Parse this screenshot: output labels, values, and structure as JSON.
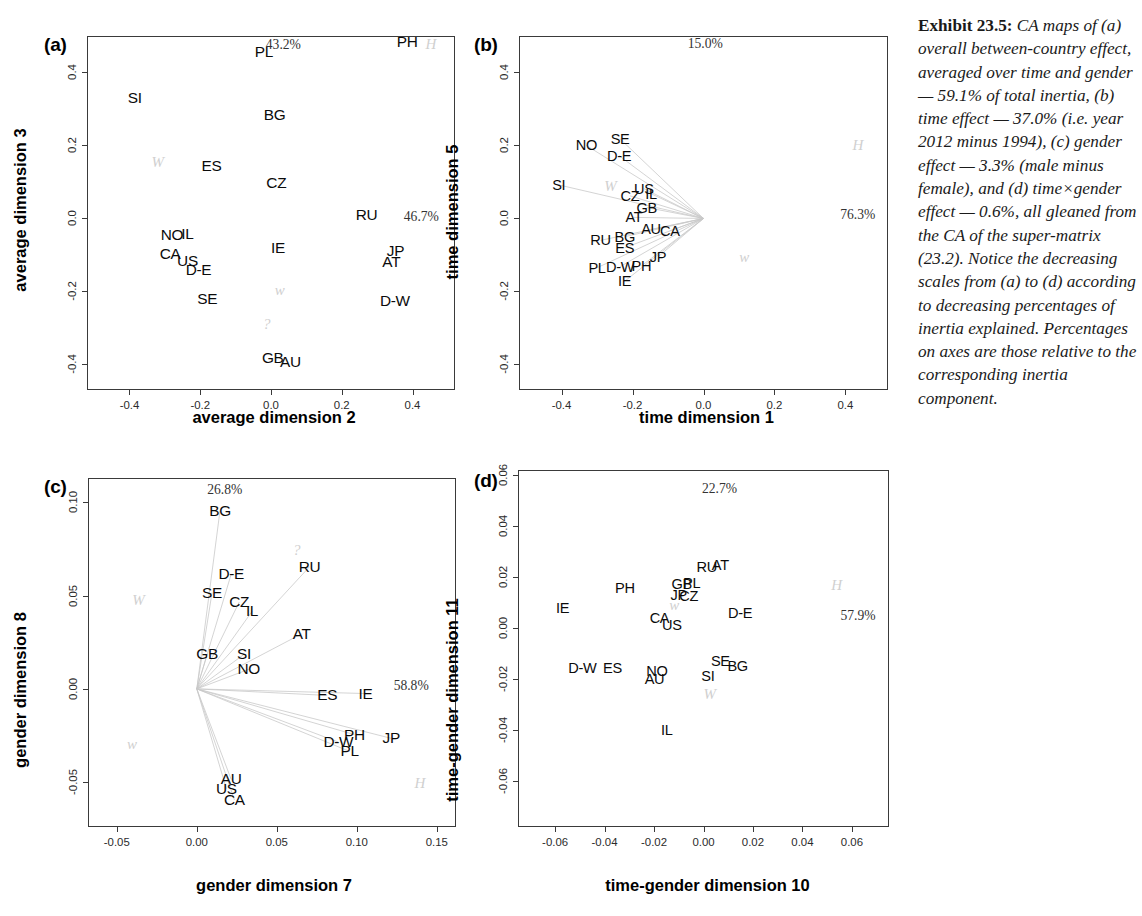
{
  "exhibit": {
    "label": "Exhibit 23.5:",
    "text": "CA maps of (a) overall between-country effect, averaged over time and gender — 59.1% of total inertia, (b) time effect — 37.0% (i.e. year 2012 minus 1994), (c) gender effect — 3.3% (male minus female), and (d) time×gender effect — 0.6%, all gleaned from the CA of the super-matrix (23.2). Notice the decreasing scales from (a) to (d) according to decreasing percentages of inertia explained. Percentages on axes are those relative to the corresponding inertia component."
  },
  "chart_data": [
    {
      "type": "scatter",
      "panel": "a",
      "panel_label": "(a)",
      "xlabel": "average dimension 2",
      "ylabel": "average dimension 3",
      "xlim": [
        -0.52,
        0.52
      ],
      "ylim": [
        -0.47,
        0.5
      ],
      "xticks": [
        -0.4,
        -0.2,
        0.0,
        0.2,
        0.4
      ],
      "xticklabels": [
        "-0.4",
        "-0.2",
        "0.0",
        "0.2",
        "0.4"
      ],
      "yticks": [
        0.4,
        0.2,
        0.0,
        -0.2,
        -0.4
      ],
      "yticklabels": [
        "0.4",
        "0.2",
        "0.0",
        "-0.2",
        "-0.4"
      ],
      "grid": false,
      "rays": false,
      "x_pct": "46.7%",
      "y_pct": "43.2%",
      "x_pct_pos": [
        0.425,
        0.005
      ],
      "y_pct_pos": [
        0.035,
        0.475
      ],
      "points": [
        {
          "label": "PL",
          "x": -0.02,
          "y": 0.455
        },
        {
          "label": "PH",
          "x": 0.385,
          "y": 0.483
        },
        {
          "label": "SI",
          "x": -0.385,
          "y": 0.33
        },
        {
          "label": "BG",
          "x": 0.01,
          "y": 0.283
        },
        {
          "label": "ES",
          "x": -0.168,
          "y": 0.143
        },
        {
          "label": "CZ",
          "x": 0.015,
          "y": 0.098
        },
        {
          "label": "RU",
          "x": 0.27,
          "y": 0.01
        },
        {
          "label": "NO",
          "x": -0.28,
          "y": -0.046
        },
        {
          "label": "IL",
          "x": -0.236,
          "y": -0.042
        },
        {
          "label": "IE",
          "x": 0.02,
          "y": -0.082
        },
        {
          "label": "JP",
          "x": 0.352,
          "y": -0.09
        },
        {
          "label": "CA",
          "x": -0.285,
          "y": -0.097
        },
        {
          "label": "US",
          "x": -0.236,
          "y": -0.116
        },
        {
          "label": "AT",
          "x": 0.34,
          "y": -0.12
        },
        {
          "label": "D-E",
          "x": -0.205,
          "y": -0.142
        },
        {
          "label": "SE",
          "x": -0.18,
          "y": -0.222
        },
        {
          "label": "D-W",
          "x": 0.35,
          "y": -0.225
        },
        {
          "label": "GB",
          "x": 0.005,
          "y": -0.382
        },
        {
          "label": "AU",
          "x": 0.055,
          "y": -0.393
        }
      ],
      "supplementary": [
        {
          "label": "H",
          "x": 0.452,
          "y": 0.478
        },
        {
          "label": "W",
          "x": -0.32,
          "y": 0.155
        },
        {
          "label": "w",
          "x": 0.025,
          "y": -0.195
        },
        {
          "label": "?",
          "x": -0.012,
          "y": -0.29
        }
      ]
    },
    {
      "type": "scatter",
      "panel": "b",
      "panel_label": "(b)",
      "xlabel": "time dimension 1",
      "ylabel": "time dimension 5",
      "xlim": [
        -0.52,
        0.52
      ],
      "ylim": [
        -0.47,
        0.5
      ],
      "xticks": [
        -0.4,
        -0.2,
        0.0,
        0.2,
        0.4
      ],
      "xticklabels": [
        "-0.4",
        "-0.2",
        "0.0",
        "0.2",
        "0.4"
      ],
      "yticks": [
        0.4,
        0.2,
        0.0,
        -0.2,
        -0.4
      ],
      "yticklabels": [
        "0.4",
        "0.2",
        "0.0",
        "-0.2",
        "-0.4"
      ],
      "grid": false,
      "rays": true,
      "ray_origin": [
        0.0,
        0.0
      ],
      "x_pct": "76.3%",
      "y_pct": "15.0%",
      "x_pct_pos": [
        0.435,
        0.01
      ],
      "y_pct_pos": [
        0.005,
        0.478
      ],
      "points": [
        {
          "label": "SE",
          "x": -0.235,
          "y": 0.218
        },
        {
          "label": "NO",
          "x": -0.33,
          "y": 0.2
        },
        {
          "label": "D-E",
          "x": -0.238,
          "y": 0.172
        },
        {
          "label": "SI",
          "x": -0.408,
          "y": 0.092
        },
        {
          "label": "US",
          "x": -0.168,
          "y": 0.082
        },
        {
          "label": "CZ",
          "x": -0.207,
          "y": 0.062
        },
        {
          "label": "IL",
          "x": -0.148,
          "y": 0.068
        },
        {
          "label": "GB",
          "x": -0.16,
          "y": 0.03
        },
        {
          "label": "AT",
          "x": -0.196,
          "y": 0.003
        },
        {
          "label": "AU",
          "x": -0.148,
          "y": -0.03
        },
        {
          "label": "CA",
          "x": -0.095,
          "y": -0.034
        },
        {
          "label": "BG",
          "x": -0.222,
          "y": -0.05
        },
        {
          "label": "RU",
          "x": -0.29,
          "y": -0.06
        },
        {
          "label": "ES",
          "x": -0.222,
          "y": -0.08
        },
        {
          "label": "JP",
          "x": -0.128,
          "y": -0.105
        },
        {
          "label": "PL",
          "x": -0.3,
          "y": -0.135
        },
        {
          "label": "D-W",
          "x": -0.235,
          "y": -0.132
        },
        {
          "label": "PH",
          "x": -0.175,
          "y": -0.13
        },
        {
          "label": "IE",
          "x": -0.222,
          "y": -0.172
        }
      ],
      "supplementary": [
        {
          "label": "H",
          "x": 0.435,
          "y": 0.2
        },
        {
          "label": "W",
          "x": -0.262,
          "y": 0.09
        },
        {
          "label": "w",
          "x": 0.115,
          "y": -0.105
        }
      ]
    },
    {
      "type": "scatter",
      "panel": "c",
      "panel_label": "(c)",
      "xlabel": "gender dimension 7",
      "ylabel": "gender dimension 8",
      "xlim": [
        -0.068,
        0.162
      ],
      "ylim": [
        -0.074,
        0.113
      ],
      "xticks": [
        -0.05,
        0.0,
        0.05,
        0.1,
        0.15
      ],
      "xticklabels": [
        "-0.05",
        "0.00",
        "0.05",
        "0.10",
        "0.15"
      ],
      "yticks": [
        0.1,
        0.05,
        0.0,
        -0.05
      ],
      "yticklabels": [
        "0.10",
        "0.05",
        "0.00",
        "-0.05"
      ],
      "grid": false,
      "rays": true,
      "ray_origin": [
        0.0,
        0.0
      ],
      "x_pct": "58.8%",
      "y_pct": "26.8%",
      "x_pct_pos": [
        0.134,
        0.0015
      ],
      "y_pct_pos": [
        0.0175,
        0.1065
      ],
      "points": [
        {
          "label": "BG",
          "x": 0.0145,
          "y": 0.0955
        },
        {
          "label": "RU",
          "x": 0.0705,
          "y": 0.0655
        },
        {
          "label": "D-E",
          "x": 0.0215,
          "y": 0.0615
        },
        {
          "label": "SE",
          "x": 0.0095,
          "y": 0.0515
        },
        {
          "label": "CZ",
          "x": 0.0265,
          "y": 0.0465
        },
        {
          "label": "IL",
          "x": 0.0345,
          "y": 0.0415
        },
        {
          "label": "AT",
          "x": 0.0655,
          "y": 0.0295
        },
        {
          "label": "GB",
          "x": 0.0065,
          "y": 0.0185
        },
        {
          "label": "SI",
          "x": 0.0295,
          "y": 0.0185
        },
        {
          "label": "NO",
          "x": 0.0325,
          "y": 0.0105
        },
        {
          "label": "ES",
          "x": 0.0815,
          "y": -0.0035
        },
        {
          "label": "IE",
          "x": 0.1055,
          "y": -0.0025
        },
        {
          "label": "PH",
          "x": 0.0985,
          "y": -0.0245
        },
        {
          "label": "JP",
          "x": 0.1215,
          "y": -0.0265
        },
        {
          "label": "D-W",
          "x": 0.0885,
          "y": -0.0285
        },
        {
          "label": "PL",
          "x": 0.0955,
          "y": -0.0335
        },
        {
          "label": "AU",
          "x": 0.0215,
          "y": -0.0485
        },
        {
          "label": "US",
          "x": 0.0185,
          "y": -0.0535
        },
        {
          "label": "CA",
          "x": 0.0235,
          "y": -0.0595
        }
      ],
      "supplementary": [
        {
          "label": "?",
          "x": 0.0625,
          "y": 0.0745
        },
        {
          "label": "W",
          "x": -0.0365,
          "y": 0.0475
        },
        {
          "label": "w",
          "x": -0.0405,
          "y": -0.0295
        },
        {
          "label": "H",
          "x": 0.1395,
          "y": -0.0505
        }
      ]
    },
    {
      "type": "scatter",
      "panel": "d",
      "panel_label": "(d)",
      "xlabel": "time-gender dimension 10",
      "ylabel": "time-gender dimension 11",
      "xlim": [
        -0.075,
        0.075
      ],
      "ylim": [
        -0.078,
        0.062
      ],
      "xticks": [
        -0.06,
        -0.04,
        -0.02,
        0.0,
        0.02,
        0.04,
        0.06
      ],
      "xticklabels": [
        "-0.06",
        "-0.04",
        "-0.02",
        "0.00",
        "0.02",
        "0.04",
        "0.06"
      ],
      "yticks": [
        0.06,
        0.04,
        0.02,
        0.0,
        -0.02,
        -0.04,
        -0.06
      ],
      "yticklabels": [
        "0.06",
        "0.04",
        "0.02",
        "0.00",
        "-0.02",
        "-0.04",
        "-0.06"
      ],
      "grid": false,
      "rays": false,
      "x_pct": "57.9%",
      "y_pct": "22.7%",
      "x_pct_pos": [
        0.0625,
        0.0048
      ],
      "y_pct_pos": [
        0.0065,
        0.0545
      ],
      "points": [
        {
          "label": "RU",
          "x": 0.0013,
          "y": 0.0238
        },
        {
          "label": "AT",
          "x": 0.0068,
          "y": 0.0248
        },
        {
          "label": "GB",
          "x": -0.0088,
          "y": 0.0172
        },
        {
          "label": "PL",
          "x": -0.0048,
          "y": 0.0176
        },
        {
          "label": "PH",
          "x": -0.0318,
          "y": 0.0158
        },
        {
          "label": "JP",
          "x": -0.01,
          "y": 0.0128
        },
        {
          "label": "CZ",
          "x": -0.006,
          "y": 0.0124
        },
        {
          "label": "IE",
          "x": -0.057,
          "y": 0.008
        },
        {
          "label": "D-E",
          "x": 0.0148,
          "y": 0.0058
        },
        {
          "label": "CA",
          "x": -0.0178,
          "y": 0.004
        },
        {
          "label": "US",
          "x": -0.0128,
          "y": 0.0012
        },
        {
          "label": "SE",
          "x": 0.0068,
          "y": -0.0128
        },
        {
          "label": "BG",
          "x": 0.0138,
          "y": -0.0148
        },
        {
          "label": "D-W",
          "x": -0.049,
          "y": -0.0158
        },
        {
          "label": "ES",
          "x": -0.0368,
          "y": -0.0158
        },
        {
          "label": "NO",
          "x": -0.0188,
          "y": -0.0168
        },
        {
          "label": "SI",
          "x": 0.0018,
          "y": -0.0188
        },
        {
          "label": "AU",
          "x": -0.0198,
          "y": -0.0198
        },
        {
          "label": "IL",
          "x": -0.0148,
          "y": -0.04
        }
      ],
      "supplementary": [
        {
          "label": "H",
          "x": 0.0538,
          "y": 0.0168
        },
        {
          "label": "w",
          "x": -0.0118,
          "y": 0.009
        },
        {
          "label": "W",
          "x": 0.0025,
          "y": -0.0258
        }
      ]
    }
  ]
}
